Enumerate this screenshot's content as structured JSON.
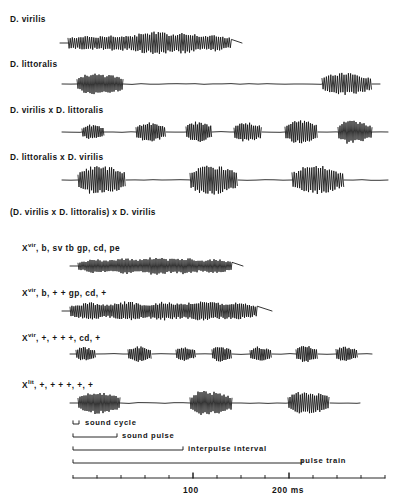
{
  "figure": {
    "stroke_color": "#111111",
    "background": "#ffffff"
  },
  "rows": [
    {
      "id": "d-virilis",
      "label": "D. virilis",
      "label_x": 10,
      "label_y": 14,
      "trace_y": 28,
      "trace_height": 30,
      "pattern": "continuous",
      "start_x": 68,
      "end_x": 232,
      "tail_x": 242,
      "cycle_px": 2.15,
      "amp": 10,
      "amp_env": [
        0.45,
        0.6,
        0.55,
        0.7,
        0.62,
        0.85,
        1.0,
        0.8,
        0.95,
        0.6,
        0.75,
        0.4
      ],
      "bursts": []
    },
    {
      "id": "d-littoralis",
      "label": "D. littoralis",
      "label_x": 10,
      "label_y": 59,
      "trace_y": 70,
      "trace_height": 28,
      "pattern": "bursts",
      "start_x": 62,
      "end_x": 380,
      "cycle_px": 2.0,
      "amp": 9,
      "bursts": [
        {
          "x0": 77,
          "x1": 123,
          "amp": 9,
          "cycle": 2.0,
          "env": [
            0.5,
            0.95,
            1.0,
            0.9,
            0.85,
            0.6
          ]
        },
        {
          "x0": 322,
          "x1": 372,
          "amp": 9.5,
          "cycle": 2.2,
          "env": [
            0.5,
            0.9,
            1.0,
            0.95,
            0.8,
            0.5
          ]
        }
      ]
    },
    {
      "id": "d-virilis-x-d-littoralis",
      "label": "D. virilis x D. littoralis",
      "label_x": 10,
      "label_y": 105,
      "trace_y": 117,
      "trace_height": 30,
      "pattern": "bursts",
      "start_x": 62,
      "end_x": 388,
      "cycle_px": 1.9,
      "amp": 8,
      "bursts": [
        {
          "x0": 82,
          "x1": 104,
          "amp": 6.5,
          "cycle": 1.9,
          "env": [
            0.55,
            1.0,
            0.85,
            0.55
          ]
        },
        {
          "x0": 136,
          "x1": 166,
          "amp": 8.5,
          "cycle": 1.9,
          "env": [
            0.5,
            0.9,
            1.0,
            0.8,
            0.5
          ]
        },
        {
          "x0": 186,
          "x1": 212,
          "amp": 9,
          "cycle": 1.9,
          "env": [
            0.6,
            1.0,
            0.9,
            0.6
          ]
        },
        {
          "x0": 234,
          "x1": 262,
          "amp": 8.5,
          "cycle": 1.95,
          "env": [
            0.55,
            1.0,
            0.9,
            0.6
          ]
        },
        {
          "x0": 285,
          "x1": 318,
          "amp": 10,
          "cycle": 1.95,
          "env": [
            0.5,
            0.95,
            1.0,
            0.85,
            0.55
          ]
        },
        {
          "x0": 338,
          "x1": 372,
          "amp": 10,
          "cycle": 2.0,
          "env": [
            0.55,
            1.0,
            0.95,
            0.8,
            0.5
          ]
        }
      ]
    },
    {
      "id": "d-littoralis-x-d-virilis",
      "label": "D. littoralis x D. virilis",
      "label_x": 10,
      "label_y": 152,
      "trace_y": 163,
      "trace_height": 34,
      "pattern": "bursts",
      "start_x": 62,
      "end_x": 388,
      "cycle_px": 2.1,
      "amp": 12,
      "bursts": [
        {
          "x0": 78,
          "x1": 126,
          "amp": 12,
          "cycle": 2.1,
          "env": [
            0.45,
            0.95,
            1.0,
            0.95,
            0.85,
            0.5
          ]
        },
        {
          "x0": 190,
          "x1": 238,
          "amp": 13,
          "cycle": 2.1,
          "env": [
            0.5,
            0.95,
            1.0,
            0.9,
            0.8,
            0.45
          ]
        },
        {
          "x0": 292,
          "x1": 344,
          "amp": 12.5,
          "cycle": 2.2,
          "env": [
            0.5,
            0.9,
            1.0,
            0.95,
            0.75,
            0.45
          ]
        }
      ]
    }
  ],
  "backcross": {
    "header": "(D. virilis x D. littoralis)  x  D. virilis",
    "header_x": 10,
    "header_y": 207
  },
  "genotypes": [
    {
      "id": "genotype-1",
      "symbol": "X",
      "superscript": "vir",
      "rest": ", b, sv tb gp, cd, pe",
      "label_x": 22,
      "label_y": 240,
      "trace_y": 252,
      "trace_height": 28,
      "pattern": "continuous",
      "start_x": 78,
      "end_x": 232,
      "tail_x": 243,
      "cycle_px": 2.0,
      "amp": 8,
      "amp_env": [
        0.4,
        0.75,
        0.6,
        0.9,
        0.7,
        1.0,
        0.75,
        0.9,
        0.6,
        0.8,
        0.45
      ],
      "bursts": []
    },
    {
      "id": "genotype-2",
      "symbol": "X",
      "superscript": "vir",
      "rest": ", b, + + gp, cd, +",
      "label_x": 22,
      "label_y": 285,
      "trace_y": 297,
      "trace_height": 28,
      "pattern": "continuous",
      "start_x": 70,
      "end_x": 258,
      "tail_x": 272,
      "cycle_px": 1.95,
      "amp": 8.5,
      "amp_env": [
        0.5,
        0.9,
        0.65,
        1.0,
        0.7,
        0.95,
        0.75,
        1.0,
        0.8,
        0.9,
        0.5
      ],
      "bursts": []
    },
    {
      "id": "genotype-3",
      "symbol": "X",
      "superscript": "vir",
      "rest": ", +, + + +, cd, +",
      "label_x": 22,
      "label_y": 330,
      "trace_y": 341,
      "trace_height": 26,
      "pattern": "bursts",
      "start_x": 70,
      "end_x": 372,
      "cycle_px": 1.85,
      "amp": 7,
      "bursts": [
        {
          "x0": 76,
          "x1": 96,
          "amp": 6.5,
          "cycle": 1.85,
          "env": [
            0.6,
            1.0,
            0.75,
            0.5
          ]
        },
        {
          "x0": 128,
          "x1": 152,
          "amp": 7,
          "cycle": 1.85,
          "env": [
            0.55,
            1.0,
            0.85,
            0.5
          ]
        },
        {
          "x0": 176,
          "x1": 196,
          "amp": 6.5,
          "cycle": 1.85,
          "env": [
            0.6,
            1.0,
            0.8,
            0.5
          ]
        },
        {
          "x0": 212,
          "x1": 232,
          "amp": 7,
          "cycle": 1.85,
          "env": [
            0.6,
            1.0,
            0.8,
            0.5
          ]
        },
        {
          "x0": 250,
          "x1": 272,
          "amp": 6.5,
          "cycle": 1.85,
          "env": [
            0.55,
            1.0,
            0.8,
            0.5
          ]
        },
        {
          "x0": 296,
          "x1": 318,
          "amp": 7.5,
          "cycle": 1.85,
          "env": [
            0.6,
            1.0,
            0.85,
            0.5
          ]
        },
        {
          "x0": 336,
          "x1": 358,
          "amp": 7,
          "cycle": 1.85,
          "env": [
            0.6,
            1.0,
            0.8,
            0.5
          ]
        }
      ]
    },
    {
      "id": "genotype-4",
      "symbol": "X",
      "superscript": "lit",
      "rest": ", +, + + +, +, +",
      "label_x": 22,
      "label_y": 377,
      "trace_y": 388,
      "trace_height": 30,
      "pattern": "bursts",
      "start_x": 70,
      "end_x": 360,
      "cycle_px": 2.0,
      "amp": 10,
      "bursts": [
        {
          "x0": 78,
          "x1": 120,
          "amp": 9.5,
          "cycle": 2.0,
          "env": [
            0.5,
            0.95,
            1.0,
            0.9,
            0.8,
            0.5
          ]
        },
        {
          "x0": 190,
          "x1": 232,
          "amp": 10.5,
          "cycle": 2.0,
          "env": [
            0.5,
            0.95,
            1.0,
            0.9,
            0.8,
            0.5
          ]
        },
        {
          "x0": 288,
          "x1": 330,
          "amp": 10,
          "cycle": 2.05,
          "env": [
            0.5,
            0.95,
            1.0,
            0.9,
            0.8,
            0.5
          ]
        }
      ]
    }
  ],
  "legend": {
    "items": [
      {
        "id": "sound-cycle",
        "label": "sound  cycle",
        "bracket_x0": 73,
        "bracket_x1": 79,
        "bracket_y": 424,
        "label_x": 85,
        "label_y": 418
      },
      {
        "id": "sound-pulse",
        "label": "sound  pulse",
        "bracket_x0": 73,
        "bracket_x1": 117,
        "bracket_y": 437,
        "label_x": 122,
        "label_y": 431
      },
      {
        "id": "interpulse-interval",
        "label": "interpulse  interval",
        "bracket_x0": 73,
        "bracket_x1": 183,
        "bracket_y": 450,
        "label_x": 188,
        "label_y": 444
      },
      {
        "id": "pulse-train",
        "label": "pulse  train",
        "bracket_x0": 73,
        "bracket_x1": 302,
        "bracket_y": 463,
        "label_x": 300,
        "label_y": 456
      }
    ]
  },
  "axis": {
    "id": "time-axis",
    "y": 478,
    "x_start": 73,
    "x_end": 385,
    "unit": "ms",
    "minor_ticks": [
      73,
      97,
      121,
      145,
      169,
      193,
      217,
      241,
      265,
      289,
      313,
      337,
      361,
      385
    ],
    "major_ticks": [
      {
        "x": 193,
        "label": "100",
        "label_x": 183,
        "label_y": 485
      },
      {
        "x": 289,
        "label": "200 ms",
        "label_x": 272,
        "label_y": 485
      }
    ]
  }
}
